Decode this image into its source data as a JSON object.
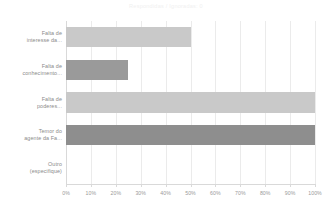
{
  "chart_data": {
    "type": "bar",
    "orientation": "horizontal",
    "title": "Respondidas / Ignoradas: 0",
    "xlabel": "",
    "ylabel": "",
    "xlim": [
      0,
      100
    ],
    "grid": true,
    "legend": "none",
    "categories": [
      "Falta de\ninteresse da...",
      "Falta de\nconhecimento...",
      "Falta de\npoderes...",
      "Temor do\nagente da Fa...",
      "Outro\n(especifique)"
    ],
    "values": [
      50,
      25,
      100,
      100,
      0
    ],
    "bar_colors": [
      "#c9c9c9",
      "#9a9a9a",
      "#c9c9c9",
      "#8e8e8e",
      "#ffffff"
    ],
    "xticks": [
      0,
      10,
      20,
      30,
      40,
      50,
      60,
      70,
      80,
      90,
      100
    ],
    "xticklabels": [
      "0%",
      "10%",
      "20%",
      "30%",
      "40%",
      "50%",
      "60%",
      "70%",
      "80%",
      "90%",
      "100%"
    ]
  },
  "categories": [
    {
      "line1": "Falta de",
      "line2": "interesse da..."
    },
    {
      "line1": "Falta de",
      "line2": "conhecimento..."
    },
    {
      "line1": "Falta de",
      "line2": "poderes..."
    },
    {
      "line1": "Temor do",
      "line2": "agente da Fa..."
    },
    {
      "line1": "Outro",
      "line2": "(especifique)"
    }
  ],
  "colors": {
    "bar_light": "#c9c9c9",
    "bar_dark": "#9a9a9a",
    "bar_darkest": "#8e8e8e",
    "grid": "#ebebeb",
    "axis": "#d9d9d9",
    "tick_text": "#9a9a9a",
    "label_text": "#8a8a8a",
    "title_text": "#f0f0f0",
    "background": "#ffffff"
  }
}
